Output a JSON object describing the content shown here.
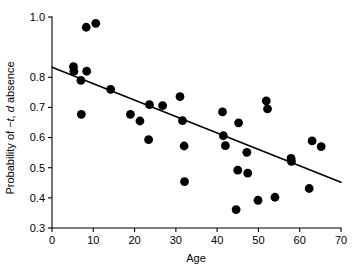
{
  "chart_data": {
    "type": "scatter",
    "title": "",
    "xlabel": "Age",
    "ylabel": "Probability of −t, d absence",
    "ylabel_parts": [
      {
        "text": "Probability of −",
        "italic": false
      },
      {
        "text": "t",
        "italic": true
      },
      {
        "text": ", ",
        "italic": false
      },
      {
        "text": "d",
        "italic": true
      },
      {
        "text": " absence",
        "italic": false
      }
    ],
    "xlim": [
      0,
      70
    ],
    "ylim": [
      0.3,
      1.0
    ],
    "xticks": [
      0,
      10,
      20,
      30,
      40,
      50,
      60,
      70
    ],
    "xtick_labels": [
      "0",
      "10",
      "20",
      "30",
      "40",
      "50",
      "60",
      "70"
    ],
    "yticks": [
      0.3,
      0.4,
      0.5,
      0.6,
      0.7,
      0.8,
      1.0
    ],
    "ytick_labels": [
      "0.3",
      "0.4",
      "0.5",
      "0.6",
      "0.7",
      "0.8",
      "1.0"
    ],
    "grid": false,
    "legend": null,
    "marker": "filled-circle",
    "marker_color": "#000000",
    "marker_size_px": 4.4,
    "points": [
      {
        "x": 5.2,
        "y": 0.835
      },
      {
        "x": 5.3,
        "y": 0.82
      },
      {
        "x": 7.0,
        "y": 0.79
      },
      {
        "x": 7.1,
        "y": 0.677
      },
      {
        "x": 8.3,
        "y": 0.966
      },
      {
        "x": 8.4,
        "y": 0.82
      },
      {
        "x": 10.6,
        "y": 0.979
      },
      {
        "x": 14.2,
        "y": 0.76
      },
      {
        "x": 19.0,
        "y": 0.677
      },
      {
        "x": 21.3,
        "y": 0.655
      },
      {
        "x": 23.4,
        "y": 0.593
      },
      {
        "x": 23.6,
        "y": 0.709
      },
      {
        "x": 26.8,
        "y": 0.706
      },
      {
        "x": 31.0,
        "y": 0.736
      },
      {
        "x": 31.6,
        "y": 0.656
      },
      {
        "x": 32.0,
        "y": 0.572
      },
      {
        "x": 32.1,
        "y": 0.454
      },
      {
        "x": 41.3,
        "y": 0.685
      },
      {
        "x": 41.5,
        "y": 0.606
      },
      {
        "x": 42.0,
        "y": 0.573
      },
      {
        "x": 44.6,
        "y": 0.361
      },
      {
        "x": 45.0,
        "y": 0.492
      },
      {
        "x": 45.2,
        "y": 0.649
      },
      {
        "x": 47.2,
        "y": 0.551
      },
      {
        "x": 47.4,
        "y": 0.482
      },
      {
        "x": 49.9,
        "y": 0.392
      },
      {
        "x": 51.9,
        "y": 0.722
      },
      {
        "x": 52.2,
        "y": 0.695
      },
      {
        "x": 54.0,
        "y": 0.402
      },
      {
        "x": 57.9,
        "y": 0.531
      },
      {
        "x": 58.0,
        "y": 0.521
      },
      {
        "x": 62.3,
        "y": 0.431
      },
      {
        "x": 63.0,
        "y": 0.589
      },
      {
        "x": 65.2,
        "y": 0.57
      }
    ],
    "fit_line": {
      "type": "linear",
      "x_start": 0,
      "y_start": 0.833,
      "x_end": 70,
      "y_end": 0.452,
      "color": "#000000"
    }
  }
}
